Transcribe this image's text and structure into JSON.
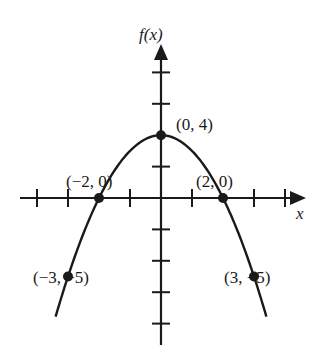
{
  "chart_data": {
    "type": "line",
    "title": "",
    "function": "f(x) = 4 - x^2",
    "xlabel": "x",
    "ylabel": "f(x)",
    "x_ticks_step": 1,
    "y_ticks_step": 2,
    "xlim": [
      -4,
      4
    ],
    "ylim": [
      -9,
      8
    ],
    "grid": false,
    "series": [
      {
        "name": "f(x)",
        "x": [
          -3.4,
          -3,
          -2,
          -1,
          0,
          1,
          2,
          3,
          3.4
        ],
        "y": [
          -7.56,
          -5,
          0,
          3,
          4,
          3,
          0,
          -5,
          -7.56
        ]
      }
    ],
    "labeled_points": [
      {
        "x": 0,
        "y": 4,
        "label": "(0, 4)"
      },
      {
        "x": -2,
        "y": 0,
        "label": "(−2, 0)"
      },
      {
        "x": 2,
        "y": 0,
        "label": "(2, 0)"
      },
      {
        "x": -3,
        "y": -5,
        "label": "(−3, −5)"
      },
      {
        "x": 3,
        "y": -5,
        "label": "(3, −5)"
      }
    ]
  },
  "labels": {
    "y_axis": "f(x)",
    "x_axis": "x",
    "p_vertex": "(0, 4)",
    "p_left_root": "(−2, 0)",
    "p_right_root": "(2, 0)",
    "p_left_low": "(−3, −5)",
    "p_right_low": "(3, −5)"
  },
  "colors": {
    "ink": "#1a1a1a",
    "background": "#ffffff"
  }
}
